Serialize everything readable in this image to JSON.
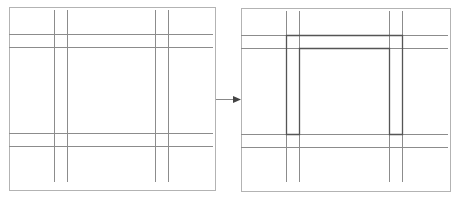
{
  "diagram": {
    "panels": [
      {
        "id": "before",
        "label": "",
        "highlight": false
      },
      {
        "id": "after",
        "label": "",
        "highlight": true
      }
    ],
    "colors": {
      "frame": "#b3b3b3",
      "grid_line": "#8c8c8c",
      "highlight": "#555555",
      "arrow": "#444444"
    },
    "arrow": {
      "from": "before",
      "to": "after"
    }
  }
}
